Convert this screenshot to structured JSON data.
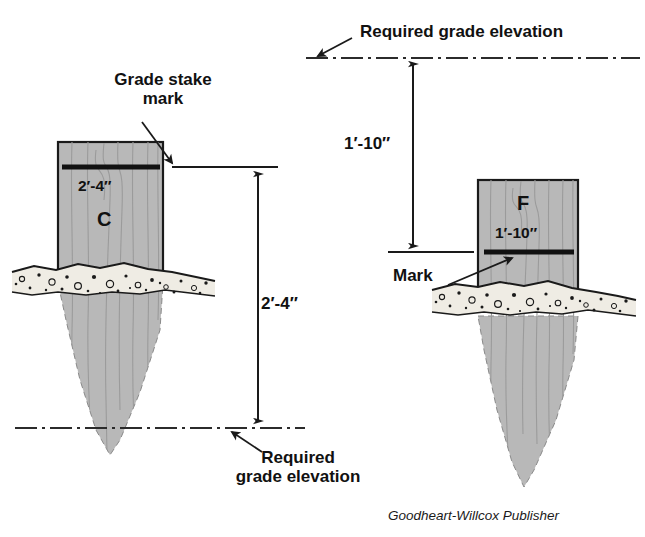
{
  "figure": {
    "credit": "Goodheart-Willcox Publisher",
    "background_color": "#ffffff",
    "stake_fill_color": "#b8b8b8",
    "stake_outline_color": "#1a1a1a",
    "mark_line_color": "#111111",
    "soil_fill_color": "#efece4",
    "line_color": "#2b2b2b"
  },
  "left_diagram": {
    "name": "cut-stake",
    "stake_letter": "C",
    "stake_mark_dimension": "2′-4″",
    "callout_label": "Grade stake\nmark",
    "dimension_label": "2′-4″",
    "grade_label": "Required\ngrade elevation",
    "grade_line_style": "dash-dot",
    "grade_line_position": "below ground"
  },
  "right_diagram": {
    "name": "fill-stake",
    "stake_letter": "F",
    "stake_mark_dimension": "1′-10″",
    "callout_label": "Mark",
    "dimension_label": "1′-10″",
    "grade_label": "Required grade elevation",
    "grade_line_style": "dash-dot",
    "grade_line_position": "above ground"
  }
}
